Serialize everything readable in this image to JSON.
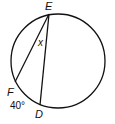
{
  "diagram": {
    "type": "circle-inscribed-angle",
    "circle": {
      "cx": 58,
      "cy": 61,
      "r": 47
    },
    "points": {
      "E": {
        "label": "E",
        "x": 49,
        "y": 14
      },
      "F": {
        "label": "F",
        "x": 15,
        "y": 82
      },
      "D": {
        "label": "D",
        "x": 40,
        "y": 105
      }
    },
    "angle_label": "x",
    "arc_label": "40°",
    "stroke_color": "#111111"
  }
}
